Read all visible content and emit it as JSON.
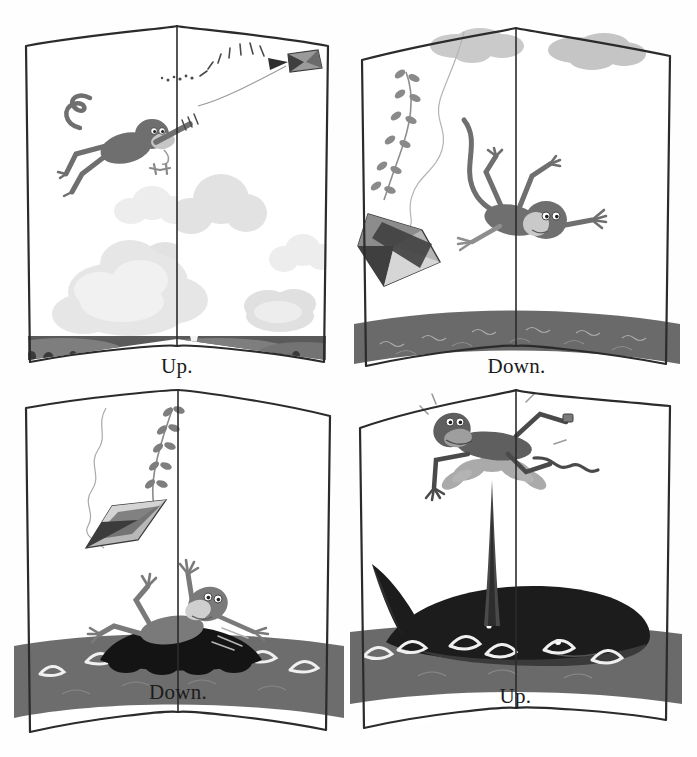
{
  "meta": {
    "layout": "2x2 grid of picture-book spreads",
    "character": "monkey",
    "story": "A monkey is carried up by a kite, falls down into the sea, lands down on a whale, and is blown up again by the whale's spout."
  },
  "colors": {
    "page_background": "#ffffff",
    "outer_background": "#ffffff",
    "ink": "#1b1b1b",
    "sea": "#6e6e6e",
    "sea_foam": "#ececec",
    "whale": "#1e1e1e",
    "land": "#5a5a5a",
    "cloud_light": "#e2e2e2",
    "cloud_mid": "#d9d9d9",
    "monkey_fur": "#7a7a7a",
    "monkey_face": "#c9c9c9",
    "kite_dark": "#4d4d4d",
    "kite_mid": "#9d9d9d",
    "kite_light": "#d9d9d9"
  },
  "panels": [
    {
      "id": "panel-up-kite",
      "position": "top-left",
      "caption": "Up.",
      "scene": "monkey-flying-with-kite-above-clouds-and-village",
      "elements": [
        "kite-in-sky",
        "kite-string",
        "flying-monkey",
        "clouds",
        "village-landscape",
        "church-steeple"
      ]
    },
    {
      "id": "panel-down-falling",
      "position": "top-right",
      "caption": "Down.",
      "scene": "monkey-falling-from-sky-with-kite-toward-sea",
      "elements": [
        "falling-kite",
        "kite-tail-vine",
        "kite-string",
        "falling-monkey",
        "clouds",
        "sea"
      ]
    },
    {
      "id": "panel-down-whale",
      "position": "bottom-left",
      "caption": "Down.",
      "scene": "monkey-landing-on-whale-back-in-the-sea",
      "elements": [
        "falling-kite",
        "kite-tail-vine",
        "kite-string",
        "monkey-on-whale",
        "whale-back",
        "sea"
      ]
    },
    {
      "id": "panel-up-spout",
      "position": "bottom-right",
      "caption": "Up.",
      "scene": "monkey-blown-upward-by-whale-spout",
      "elements": [
        "whale",
        "whale-tail",
        "whale-eye",
        "whale-spout",
        "monkey-on-spout",
        "sea"
      ]
    }
  ]
}
